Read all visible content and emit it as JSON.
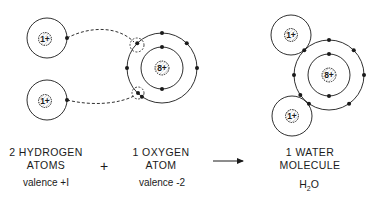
{
  "diagram": {
    "stroke_color": "#1a1a1a",
    "background": "#ffffff"
  },
  "reactants": {
    "hydrogen": {
      "line1": "2 HYDROGEN",
      "line2": "ATOMS",
      "valence": "valence +I",
      "nucleus_label": "1+",
      "atoms": [
        {
          "cx": 47,
          "cy": 38,
          "shell_r": 20,
          "electron_angle_deg": 0
        },
        {
          "cx": 47,
          "cy": 100,
          "shell_r": 20,
          "electron_angle_deg": 0
        }
      ]
    },
    "operator": "+",
    "oxygen": {
      "line1": "1 OXYGEN",
      "line2": "ATOM",
      "valence": "valence -2",
      "nucleus_label": "8+",
      "cx": 162,
      "cy": 68,
      "inner_shell_r": 21,
      "outer_shell_r": 35,
      "inner_electrons_deg": [
        90,
        270
      ],
      "outer_electrons_deg": [
        0,
        45,
        90,
        135,
        180,
        235
      ],
      "vacancies": [
        {
          "cx": 137,
          "cy": 45,
          "r": 7,
          "filled": false
        },
        {
          "cx": 138,
          "cy": 93,
          "r": 6,
          "filled": true
        }
      ]
    }
  },
  "arrow": {
    "x1": 213,
    "x2": 243,
    "y": 161
  },
  "product": {
    "line1": "1 WATER",
    "line2": "MOLECULE",
    "formula_main": "H",
    "formula_sub": "2",
    "formula_end": "O",
    "oxygen": {
      "cx": 329,
      "cy": 75,
      "inner_shell_r": 21,
      "outer_shell_r": 35,
      "nucleus_label": "8+",
      "inner_electrons_deg": [
        90,
        270
      ],
      "outer_electrons_deg": [
        0,
        45,
        90,
        135,
        180,
        235,
        305,
        215
      ]
    },
    "hydrogens": [
      {
        "cx": 291,
        "cy": 35,
        "shell_r": 20,
        "nucleus_label": "1+"
      },
      {
        "cx": 292,
        "cy": 116,
        "shell_r": 20,
        "nucleus_label": "1+"
      }
    ]
  }
}
